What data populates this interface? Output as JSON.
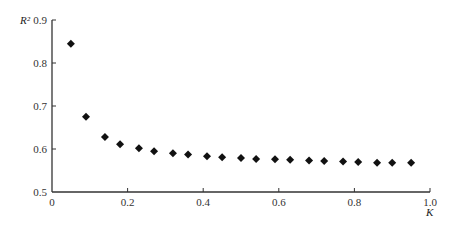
{
  "chart_data": {
    "type": "scatter",
    "title": "",
    "xlabel": "K",
    "ylabel": "R²",
    "xlim": [
      0,
      1.0
    ],
    "ylim": [
      0.5,
      0.9
    ],
    "grid": false,
    "legend": null,
    "marker": "diamond",
    "x_ticks": [
      0,
      0.2,
      0.4,
      0.6,
      0.8,
      1.0
    ],
    "x_tick_labels": [
      "0",
      "0.2",
      "0.4",
      "0.6",
      "0.8",
      "1.0"
    ],
    "y_ticks": [
      0.5,
      0.6,
      0.7,
      0.8,
      0.9
    ],
    "y_tick_labels": [
      "0.5",
      "0.6",
      "0.7",
      "0.8",
      "0.9"
    ],
    "series": [
      {
        "name": "R²",
        "x": [
          0.05,
          0.09,
          0.14,
          0.18,
          0.23,
          0.27,
          0.32,
          0.36,
          0.41,
          0.45,
          0.5,
          0.54,
          0.59,
          0.63,
          0.68,
          0.72,
          0.77,
          0.81,
          0.86,
          0.9,
          0.95
        ],
        "y": [
          0.845,
          0.675,
          0.628,
          0.611,
          0.602,
          0.595,
          0.59,
          0.587,
          0.583,
          0.581,
          0.579,
          0.577,
          0.576,
          0.575,
          0.573,
          0.572,
          0.571,
          0.57,
          0.568,
          0.568,
          0.568
        ]
      }
    ]
  },
  "style": {
    "axis_color": "#333333",
    "marker_color": "#111111"
  }
}
